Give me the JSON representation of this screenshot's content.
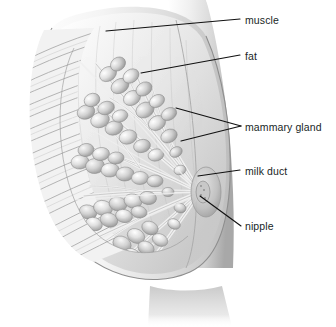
{
  "figure": {
    "style": "grayscale pencil medical illustration",
    "background_color": "#ffffff",
    "label_color": "#201f1f",
    "leader_color": "#111111"
  },
  "labels": [
    {
      "id": "muscle",
      "text": "muscle",
      "text_x": 245,
      "text_y": 15,
      "leader": {
        "x1": 106,
        "y1": 31,
        "x2": 240,
        "y2": 19
      }
    },
    {
      "id": "fat",
      "text": "fat",
      "text_x": 245,
      "text_y": 51,
      "leader": {
        "x1": 141,
        "y1": 73,
        "x2": 240,
        "y2": 55
      }
    },
    {
      "id": "mammary-gland",
      "text": "mammary gland",
      "text_x": 245,
      "text_y": 122,
      "leader": {
        "x1": 176,
        "y1": 108,
        "x2": 241,
        "y2": 126
      },
      "leader2": {
        "x1": 181,
        "y1": 141,
        "x2": 241,
        "y2": 126
      }
    },
    {
      "id": "milk-duct",
      "text": "milk duct",
      "text_x": 245,
      "text_y": 166,
      "leader": {
        "x1": 198,
        "y1": 176,
        "x2": 240,
        "y2": 170
      }
    },
    {
      "id": "nipple",
      "text": "nipple",
      "text_x": 245,
      "text_y": 221,
      "leader": {
        "x1": 200,
        "y1": 196,
        "x2": 241,
        "y2": 226
      }
    }
  ],
  "anatomy": {
    "muscle_region": "diagonal striated chest wall muscle fanning upper-left",
    "fat_region": "subcutaneous fat between skin and gland",
    "gland_region": "grape-like lobule clusters radiating toward nipple",
    "duct_region": "branching milk ducts converging at nipple",
    "nipple_region": "nipple and areola at right edge of breast"
  }
}
